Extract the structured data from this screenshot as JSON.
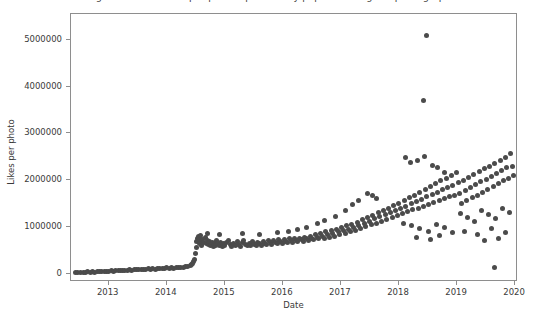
{
  "chart_data": {
    "type": "scatter",
    "title": "Average number of likes per photo uploaded by popular Instagram photographers",
    "xlabel": "Date",
    "ylabel": "Likes per photo",
    "xlim": [
      2012.35,
      2020.05
    ],
    "ylim": [
      -180000,
      5550000
    ],
    "xticks": [
      2013,
      2014,
      2015,
      2016,
      2017,
      2018,
      2019,
      2020
    ],
    "xtick_labels": [
      "2013",
      "2014",
      "2015",
      "2016",
      "2017",
      "2018",
      "2019",
      "2020"
    ],
    "yticks": [
      0,
      1000000,
      2000000,
      3000000,
      4000000,
      5000000
    ],
    "ytick_labels": [
      "0",
      "1000000",
      "2000000",
      "3000000",
      "4000000",
      "5000000"
    ],
    "grid": false,
    "legend": null,
    "marker": {
      "shape": "circle",
      "color": "#4b4b4b",
      "size_px": 5
    },
    "axes": {
      "frame_color": "#8e8e8e",
      "background": "#ffffff"
    },
    "annotations": [
      {
        "label": "extreme outlier",
        "x": 2018.47,
        "y": 5100000
      },
      {
        "label": "secondary outlier",
        "x": 2018.43,
        "y": 3700000
      },
      {
        "label": "late low outlier",
        "x": 2019.65,
        "y": 120000
      },
      {
        "label": "regime shift",
        "x": 2014.55,
        "y": 650000
      }
    ],
    "points": [
      [
        2012.42,
        20000
      ],
      [
        2012.47,
        25000
      ],
      [
        2012.52,
        18000
      ],
      [
        2012.56,
        30000
      ],
      [
        2012.6,
        22000
      ],
      [
        2012.64,
        35000
      ],
      [
        2012.68,
        28000
      ],
      [
        2012.72,
        40000
      ],
      [
        2012.76,
        33000
      ],
      [
        2012.8,
        45000
      ],
      [
        2012.84,
        38000
      ],
      [
        2012.88,
        50000
      ],
      [
        2012.92,
        42000
      ],
      [
        2012.96,
        55000
      ],
      [
        2013.0,
        48000
      ],
      [
        2013.04,
        60000
      ],
      [
        2013.08,
        52000
      ],
      [
        2013.12,
        65000
      ],
      [
        2013.16,
        58000
      ],
      [
        2013.2,
        70000
      ],
      [
        2013.24,
        62000
      ],
      [
        2013.28,
        75000
      ],
      [
        2013.32,
        68000
      ],
      [
        2013.36,
        80000
      ],
      [
        2013.4,
        72000
      ],
      [
        2013.44,
        85000
      ],
      [
        2013.48,
        78000
      ],
      [
        2013.52,
        90000
      ],
      [
        2013.56,
        82000
      ],
      [
        2013.6,
        95000
      ],
      [
        2013.64,
        88000
      ],
      [
        2013.68,
        100000
      ],
      [
        2013.72,
        92000
      ],
      [
        2013.76,
        105000
      ],
      [
        2013.8,
        98000
      ],
      [
        2013.84,
        110000
      ],
      [
        2013.88,
        102000
      ],
      [
        2013.92,
        115000
      ],
      [
        2013.96,
        108000
      ],
      [
        2014.0,
        120000
      ],
      [
        2014.04,
        112000
      ],
      [
        2014.08,
        125000
      ],
      [
        2014.12,
        118000
      ],
      [
        2014.16,
        132000
      ],
      [
        2014.2,
        126000
      ],
      [
        2014.24,
        140000
      ],
      [
        2014.28,
        135000
      ],
      [
        2014.32,
        150000
      ],
      [
        2014.36,
        160000
      ],
      [
        2014.4,
        175000
      ],
      [
        2014.42,
        190000
      ],
      [
        2014.44,
        210000
      ],
      [
        2014.46,
        250000
      ],
      [
        2014.48,
        300000
      ],
      [
        2014.5,
        420000
      ],
      [
        2014.51,
        560000
      ],
      [
        2014.52,
        680000
      ],
      [
        2014.53,
        740000
      ],
      [
        2014.54,
        800000
      ],
      [
        2014.55,
        700000
      ],
      [
        2014.56,
        640000
      ],
      [
        2014.57,
        760000
      ],
      [
        2014.58,
        820000
      ],
      [
        2014.59,
        690000
      ],
      [
        2014.6,
        600000
      ],
      [
        2014.62,
        720000
      ],
      [
        2014.64,
        660000
      ],
      [
        2014.66,
        780000
      ],
      [
        2014.68,
        640000
      ],
      [
        2014.7,
        700000
      ],
      [
        2014.72,
        620000
      ],
      [
        2014.74,
        680000
      ],
      [
        2014.76,
        600000
      ],
      [
        2014.78,
        660000
      ],
      [
        2014.8,
        580000
      ],
      [
        2014.82,
        640000
      ],
      [
        2014.84,
        610000
      ],
      [
        2014.86,
        700000
      ],
      [
        2014.88,
        650000
      ],
      [
        2014.9,
        590000
      ],
      [
        2014.92,
        670000
      ],
      [
        2014.94,
        620000
      ],
      [
        2014.96,
        580000
      ],
      [
        2014.98,
        640000
      ],
      [
        2015.0,
        600000
      ],
      [
        2015.03,
        660000
      ],
      [
        2015.06,
        700000
      ],
      [
        2015.09,
        620000
      ],
      [
        2015.12,
        580000
      ],
      [
        2015.15,
        640000
      ],
      [
        2015.18,
        600000
      ],
      [
        2015.21,
        680000
      ],
      [
        2015.24,
        620000
      ],
      [
        2015.27,
        580000
      ],
      [
        2015.3,
        660000
      ],
      [
        2015.33,
        700000
      ],
      [
        2015.36,
        620000
      ],
      [
        2015.39,
        590000
      ],
      [
        2015.42,
        650000
      ],
      [
        2015.45,
        610000
      ],
      [
        2015.48,
        680000
      ],
      [
        2015.51,
        630000
      ],
      [
        2015.54,
        600000
      ],
      [
        2015.57,
        670000
      ],
      [
        2015.6,
        640000
      ],
      [
        2015.63,
        610000
      ],
      [
        2015.66,
        690000
      ],
      [
        2015.69,
        650000
      ],
      [
        2015.72,
        620000
      ],
      [
        2015.75,
        700000
      ],
      [
        2015.78,
        660000
      ],
      [
        2015.81,
        630000
      ],
      [
        2015.84,
        710000
      ],
      [
        2015.87,
        670000
      ],
      [
        2015.9,
        640000
      ],
      [
        2015.93,
        720000
      ],
      [
        2015.96,
        680000
      ],
      [
        2015.99,
        650000
      ],
      [
        2016.02,
        730000
      ],
      [
        2016.05,
        690000
      ],
      [
        2016.08,
        660000
      ],
      [
        2016.11,
        740000
      ],
      [
        2016.14,
        700000
      ],
      [
        2016.17,
        670000
      ],
      [
        2016.2,
        750000
      ],
      [
        2016.23,
        710000
      ],
      [
        2016.26,
        680000
      ],
      [
        2016.29,
        760000
      ],
      [
        2016.32,
        720000
      ],
      [
        2016.35,
        690000
      ],
      [
        2016.38,
        780000
      ],
      [
        2016.41,
        740000
      ],
      [
        2016.44,
        700000
      ],
      [
        2016.47,
        800000
      ],
      [
        2016.5,
        760000
      ],
      [
        2016.53,
        720000
      ],
      [
        2016.56,
        830000
      ],
      [
        2016.59,
        780000
      ],
      [
        2016.62,
        740000
      ],
      [
        2016.65,
        860000
      ],
      [
        2016.68,
        800000
      ],
      [
        2016.71,
        760000
      ],
      [
        2016.74,
        890000
      ],
      [
        2016.77,
        830000
      ],
      [
        2016.8,
        780000
      ],
      [
        2016.83,
        920000
      ],
      [
        2016.86,
        860000
      ],
      [
        2016.89,
        800000
      ],
      [
        2016.92,
        950000
      ],
      [
        2016.95,
        890000
      ],
      [
        2016.98,
        830000
      ],
      [
        2017.01,
        980000
      ],
      [
        2017.04,
        920000
      ],
      [
        2017.07,
        860000
      ],
      [
        2017.1,
        1020000
      ],
      [
        2017.13,
        950000
      ],
      [
        2017.16,
        890000
      ],
      [
        2017.19,
        1060000
      ],
      [
        2017.22,
        990000
      ],
      [
        2017.25,
        920000
      ],
      [
        2017.28,
        1100000
      ],
      [
        2017.31,
        1030000
      ],
      [
        2017.34,
        960000
      ],
      [
        2017.37,
        1150000
      ],
      [
        2017.4,
        1070000
      ],
      [
        2017.43,
        1000000
      ],
      [
        2017.46,
        1200000
      ],
      [
        2017.49,
        1120000
      ],
      [
        2017.52,
        1040000
      ],
      [
        2017.55,
        1250000
      ],
      [
        2017.58,
        1170000
      ],
      [
        2017.61,
        1080000
      ],
      [
        2017.64,
        1300000
      ],
      [
        2017.67,
        1210000
      ],
      [
        2017.7,
        1120000
      ],
      [
        2017.73,
        1350000
      ],
      [
        2017.76,
        1260000
      ],
      [
        2017.79,
        1160000
      ],
      [
        2017.82,
        1400000
      ],
      [
        2017.85,
        1300000
      ],
      [
        2017.88,
        1200000
      ],
      [
        2017.91,
        1450000
      ],
      [
        2017.94,
        1340000
      ],
      [
        2017.97,
        1240000
      ],
      [
        2017.45,
        1720000
      ],
      [
        2017.55,
        1660000
      ],
      [
        2017.62,
        1600000
      ],
      [
        2018.0,
        1500000
      ],
      [
        2018.03,
        1390000
      ],
      [
        2018.06,
        1280000
      ],
      [
        2018.09,
        1560000
      ],
      [
        2018.12,
        1440000
      ],
      [
        2018.15,
        1320000
      ],
      [
        2018.18,
        1620000
      ],
      [
        2018.21,
        1490000
      ],
      [
        2018.24,
        1360000
      ],
      [
        2018.27,
        1680000
      ],
      [
        2018.3,
        1540000
      ],
      [
        2018.33,
        1400000
      ],
      [
        2018.36,
        1740000
      ],
      [
        2018.39,
        1590000
      ],
      [
        2018.42,
        1440000
      ],
      [
        2018.45,
        1800000
      ],
      [
        2018.48,
        1640000
      ],
      [
        2018.51,
        1480000
      ],
      [
        2018.54,
        1860000
      ],
      [
        2018.57,
        1690000
      ],
      [
        2018.6,
        1520000
      ],
      [
        2018.63,
        1920000
      ],
      [
        2018.66,
        1740000
      ],
      [
        2018.69,
        1560000
      ],
      [
        2018.72,
        1980000
      ],
      [
        2018.75,
        1790000
      ],
      [
        2018.78,
        1600000
      ],
      [
        2018.81,
        2040000
      ],
      [
        2018.84,
        1840000
      ],
      [
        2018.87,
        1640000
      ],
      [
        2018.9,
        2100000
      ],
      [
        2018.93,
        1890000
      ],
      [
        2018.96,
        1680000
      ],
      [
        2018.99,
        2160000
      ],
      [
        2018.2,
        2380000
      ],
      [
        2018.32,
        2420000
      ],
      [
        2018.44,
        2500000
      ],
      [
        2018.58,
        2320000
      ],
      [
        2018.66,
        2260000
      ],
      [
        2018.78,
        2160000
      ],
      [
        2018.12,
        2480000
      ],
      [
        2018.47,
        5100000
      ],
      [
        2018.43,
        3700000
      ],
      [
        2018.08,
        1080000
      ],
      [
        2018.22,
        1020000
      ],
      [
        2018.36,
        960000
      ],
      [
        2018.5,
        900000
      ],
      [
        2018.64,
        1060000
      ],
      [
        2018.78,
        980000
      ],
      [
        2018.92,
        880000
      ],
      [
        2018.3,
        780000
      ],
      [
        2018.55,
        720000
      ],
      [
        2018.7,
        820000
      ],
      [
        2019.02,
        1940000
      ],
      [
        2019.05,
        1720000
      ],
      [
        2019.08,
        1500000
      ],
      [
        2019.11,
        2000000
      ],
      [
        2019.14,
        1780000
      ],
      [
        2019.17,
        1560000
      ],
      [
        2019.2,
        2060000
      ],
      [
        2019.23,
        1840000
      ],
      [
        2019.26,
        1620000
      ],
      [
        2019.29,
        2120000
      ],
      [
        2019.32,
        1900000
      ],
      [
        2019.35,
        1680000
      ],
      [
        2019.38,
        2180000
      ],
      [
        2019.41,
        1960000
      ],
      [
        2019.44,
        1740000
      ],
      [
        2019.47,
        2240000
      ],
      [
        2019.5,
        2020000
      ],
      [
        2019.53,
        1800000
      ],
      [
        2019.56,
        2300000
      ],
      [
        2019.59,
        2080000
      ],
      [
        2019.62,
        1860000
      ],
      [
        2019.65,
        2360000
      ],
      [
        2019.68,
        2140000
      ],
      [
        2019.71,
        1920000
      ],
      [
        2019.74,
        2420000
      ],
      [
        2019.77,
        2200000
      ],
      [
        2019.8,
        1980000
      ],
      [
        2019.83,
        2480000
      ],
      [
        2019.86,
        2260000
      ],
      [
        2019.89,
        2040000
      ],
      [
        2019.92,
        2560000
      ],
      [
        2019.95,
        2300000
      ],
      [
        2019.98,
        2100000
      ],
      [
        2019.06,
        1280000
      ],
      [
        2019.18,
        1200000
      ],
      [
        2019.3,
        1120000
      ],
      [
        2019.42,
        1340000
      ],
      [
        2019.54,
        1260000
      ],
      [
        2019.66,
        1180000
      ],
      [
        2019.78,
        1400000
      ],
      [
        2019.9,
        1300000
      ],
      [
        2019.12,
        900000
      ],
      [
        2019.36,
        840000
      ],
      [
        2019.6,
        960000
      ],
      [
        2019.84,
        880000
      ],
      [
        2019.48,
        700000
      ],
      [
        2019.72,
        760000
      ],
      [
        2019.65,
        120000
      ],
      [
        2017.2,
        1480000
      ],
      [
        2017.3,
        1560000
      ],
      [
        2017.08,
        1340000
      ],
      [
        2016.6,
        1080000
      ],
      [
        2016.72,
        1140000
      ],
      [
        2016.9,
        1220000
      ],
      [
        2015.3,
        860000
      ],
      [
        2015.6,
        840000
      ],
      [
        2015.9,
        880000
      ],
      [
        2014.7,
        860000
      ],
      [
        2014.9,
        840000
      ],
      [
        2016.1,
        900000
      ],
      [
        2016.25,
        940000
      ],
      [
        2016.4,
        980000
      ]
    ]
  }
}
